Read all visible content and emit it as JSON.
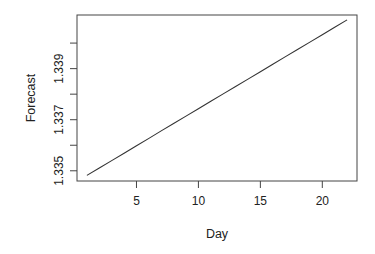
{
  "chart_data": {
    "type": "line",
    "title": "",
    "xlabel": "Day",
    "ylabel": "Forecast",
    "xlim": [
      0.2,
      22.8
    ],
    "ylim": [
      1.3346,
      1.3411
    ],
    "x_ticks": [
      5,
      10,
      15,
      20
    ],
    "x_tick_labels": [
      "5",
      "10",
      "15",
      "20"
    ],
    "y_ticks": [
      1.335,
      1.336,
      1.337,
      1.338,
      1.339,
      1.34
    ],
    "y_tick_labels": [
      "1.335",
      "",
      "1.337",
      "",
      "1.339",
      ""
    ],
    "grid": false,
    "legend": null,
    "series": [
      {
        "name": "Forecast",
        "color": "#333333",
        "x": [
          1,
          2,
          3,
          4,
          5,
          6,
          7,
          8,
          9,
          10,
          11,
          12,
          13,
          14,
          15,
          16,
          17,
          18,
          19,
          20,
          21,
          22
        ],
        "y": [
          1.33482,
          1.33511,
          1.3354,
          1.33569,
          1.33598,
          1.33627,
          1.33656,
          1.33685,
          1.33714,
          1.33743,
          1.33772,
          1.33801,
          1.3383,
          1.33859,
          1.33888,
          1.33917,
          1.33946,
          1.33975,
          1.34004,
          1.34033,
          1.34062,
          1.34091
        ]
      }
    ]
  }
}
